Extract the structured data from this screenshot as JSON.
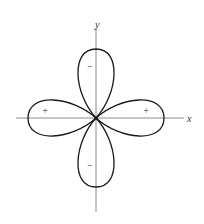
{
  "diagram": {
    "axes": {
      "x_label": "x",
      "y_label": "y"
    },
    "lobes": [
      {
        "position": "right",
        "sign": "+"
      },
      {
        "position": "left",
        "sign": "+"
      },
      {
        "position": "top",
        "sign": "−"
      },
      {
        "position": "bottom",
        "sign": "−"
      }
    ]
  }
}
